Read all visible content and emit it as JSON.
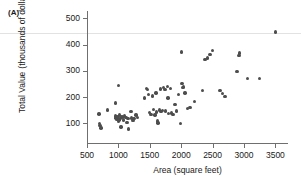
{
  "panel": {
    "label": "(A)"
  },
  "chart_data": {
    "type": "scatter",
    "title": "",
    "xlabel": "Area (square feet)",
    "ylabel": "Total Value (thousands of dollars)",
    "ylabel_line1": "Total Value",
    "ylabel_line2": "(thousands of dollars)",
    "xlim": [
      500,
      3600
    ],
    "ylim": [
      60,
      510
    ],
    "xticks": [
      500,
      1000,
      1500,
      2000,
      2500,
      3000,
      3500
    ],
    "yticks": [
      100,
      200,
      300,
      400,
      500
    ],
    "xtick_labels": [
      "500",
      "1000",
      "1500",
      "2000",
      "2500",
      "3000",
      "3500"
    ],
    "ytick_labels": [
      "100",
      "200",
      "300",
      "400",
      "500"
    ],
    "grid": false,
    "legend": null,
    "marker_color": "#4d4d4d",
    "points": [
      [
        690,
        135
      ],
      [
        700,
        100
      ],
      [
        705,
        92
      ],
      [
        720,
        82
      ],
      [
        830,
        150
      ],
      [
        950,
        178
      ],
      [
        955,
        128
      ],
      [
        960,
        120
      ],
      [
        975,
        115
      ],
      [
        980,
        126
      ],
      [
        990,
        118
      ],
      [
        1000,
        108
      ],
      [
        1000,
        243
      ],
      [
        1005,
        122
      ],
      [
        1010,
        112
      ],
      [
        1020,
        131
      ],
      [
        1030,
        119
      ],
      [
        1040,
        86
      ],
      [
        1060,
        124
      ],
      [
        1080,
        112
      ],
      [
        1100,
        128
      ],
      [
        1120,
        121
      ],
      [
        1140,
        103
      ],
      [
        1150,
        118
      ],
      [
        1160,
        79
      ],
      [
        1200,
        145
      ],
      [
        1210,
        120
      ],
      [
        1230,
        110
      ],
      [
        1250,
        118
      ],
      [
        1280,
        131
      ],
      [
        1300,
        123
      ],
      [
        1420,
        196
      ],
      [
        1450,
        232
      ],
      [
        1460,
        228
      ],
      [
        1480,
        210
      ],
      [
        1500,
        141
      ],
      [
        1520,
        133
      ],
      [
        1540,
        204
      ],
      [
        1560,
        152
      ],
      [
        1580,
        131
      ],
      [
        1600,
        216
      ],
      [
        1610,
        143
      ],
      [
        1620,
        109
      ],
      [
        1630,
        101
      ],
      [
        1650,
        150
      ],
      [
        1670,
        231
      ],
      [
        1680,
        146
      ],
      [
        1700,
        149
      ],
      [
        1720,
        236
      ],
      [
        1740,
        228
      ],
      [
        1750,
        147
      ],
      [
        1780,
        240
      ],
      [
        1790,
        197
      ],
      [
        1800,
        138
      ],
      [
        1830,
        232
      ],
      [
        1850,
        139
      ],
      [
        1870,
        133
      ],
      [
        1900,
        172
      ],
      [
        1930,
        147
      ],
      [
        1960,
        210
      ],
      [
        1990,
        100
      ],
      [
        2000,
        372
      ],
      [
        2010,
        252
      ],
      [
        2020,
        237
      ],
      [
        2040,
        238
      ],
      [
        2060,
        215
      ],
      [
        2100,
        156
      ],
      [
        2140,
        161
      ],
      [
        2210,
        183
      ],
      [
        2340,
        225
      ],
      [
        2380,
        344
      ],
      [
        2420,
        349
      ],
      [
        2460,
        363
      ],
      [
        2500,
        378
      ],
      [
        2620,
        224
      ],
      [
        2660,
        213
      ],
      [
        2700,
        203
      ],
      [
        2890,
        297
      ],
      [
        2920,
        359
      ],
      [
        2930,
        368
      ],
      [
        3060,
        271
      ],
      [
        3250,
        270
      ],
      [
        3500,
        448
      ]
    ]
  }
}
